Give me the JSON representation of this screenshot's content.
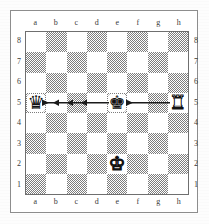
{
  "diagram": {
    "type": "chess-board",
    "orientation": "white-bottom",
    "files_top": [
      "a",
      "b",
      "c",
      "d",
      "e",
      "f",
      "g",
      "h"
    ],
    "files_bottom": [
      "a",
      "b",
      "c",
      "d",
      "e",
      "f",
      "g",
      "h"
    ],
    "ranks_left": [
      "8",
      "7",
      "6",
      "5",
      "4",
      "3",
      "2",
      "1"
    ],
    "ranks_right": [
      "8",
      "7",
      "6",
      "5",
      "4",
      "3",
      "2",
      "1"
    ],
    "colors": {
      "light_square": "#ffffff",
      "dark_square": "#7d7d7d",
      "border": "#6f6f6f",
      "outer_frame": "#8d8d8d",
      "piece_black": "#111111",
      "piece_white_fill": "#ffffff",
      "piece_white_outline": "#111111",
      "arrow": "#1a1a1a",
      "page_background": "#fdfdfd"
    },
    "squares": [
      [
        "light",
        "dark",
        "light",
        "dark",
        "light",
        "dark",
        "light",
        "dark"
      ],
      [
        "dark",
        "light",
        "dark",
        "light",
        "dark",
        "light",
        "dark",
        "light"
      ],
      [
        "light",
        "dark",
        "light",
        "dark",
        "light",
        "dark",
        "light",
        "dark"
      ],
      [
        "dark",
        "light",
        "dark",
        "light",
        "dark",
        "light",
        "dark",
        "light"
      ],
      [
        "light",
        "dark",
        "light",
        "dark",
        "light",
        "dark",
        "light",
        "dark"
      ],
      [
        "dark",
        "light",
        "dark",
        "light",
        "dark",
        "light",
        "dark",
        "light"
      ],
      [
        "light",
        "dark",
        "light",
        "dark",
        "light",
        "dark",
        "light",
        "dark"
      ],
      [
        "dark",
        "light",
        "dark",
        "light",
        "dark",
        "light",
        "dark",
        "light"
      ]
    ],
    "pieces": [
      {
        "square": "a5",
        "file": 0,
        "rank_index": 3,
        "color": "black",
        "type": "queen",
        "glyph": "♛",
        "name": "black-queen"
      },
      {
        "square": "e5",
        "file": 4,
        "rank_index": 3,
        "color": "black",
        "type": "king",
        "glyph": "♚",
        "name": "black-king"
      },
      {
        "square": "h5",
        "file": 7,
        "rank_index": 3,
        "color": "white",
        "type": "rook",
        "glyph": "♜",
        "name": "white-rook"
      },
      {
        "square": "e2",
        "file": 4,
        "rank_index": 6,
        "color": "white",
        "type": "king",
        "glyph": "♚",
        "name": "white-king"
      }
    ],
    "arrows": [
      {
        "name": "arrow-h5-to-e5",
        "from": "h5",
        "to": "e5",
        "direction": "left",
        "rank": "5"
      },
      {
        "name": "arrow-e5-to-a5",
        "from": "e5",
        "to": "a5",
        "direction": "left",
        "rank": "5"
      }
    ],
    "fen": "8/8/8/q3k2R/8/8/4K3/8 w - - 0 1"
  }
}
